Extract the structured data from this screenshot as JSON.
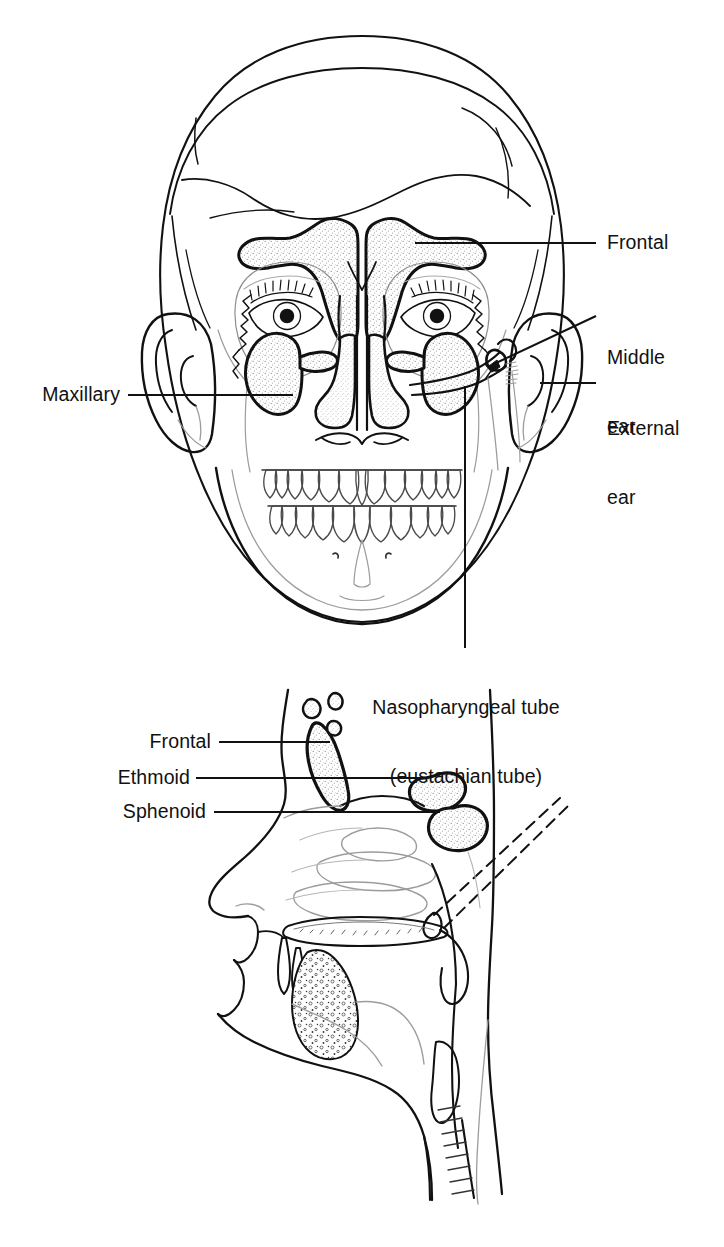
{
  "figure": {
    "kind": "anatomical-line-drawing",
    "panels": [
      {
        "id": "anterior-view",
        "name": "Anterior (frontal) view of skull with sinuses",
        "description": "Front-facing head showing frontal and maxillary sinuses, nasal cavity, orbits, eyes, ears, teeth and mandible"
      },
      {
        "id": "sagittal-view",
        "name": "Midsagittal section of head",
        "description": "Side cut-away showing frontal, ethmoid and sphenoid sinuses, turbinates, hard palate, tongue, epiglottis and pharynx"
      }
    ],
    "ink_color": "#111111",
    "background_color": "#ffffff",
    "stipple_color": "#9a9a9a"
  },
  "labels": {
    "frontal_top": "Frontal",
    "middle_ear_line1": "Middle",
    "middle_ear_line2": "ear",
    "external_ear_line1": "External",
    "external_ear_line2": "ear",
    "maxillary": "Maxillary",
    "nasopharyngeal_line1": "Nasopharyngeal tube",
    "nasopharyngeal_line2": "(eustachian tube)",
    "frontal_lower": "Frontal",
    "ethmoid": "Ethmoid",
    "sphenoid": "Sphenoid"
  },
  "structures": {
    "anterior": [
      "frontal sinus (left)",
      "frontal sinus (right)",
      "maxillary sinus (left)",
      "maxillary sinus (right)",
      "nasal cavity",
      "nasal septum",
      "orbit",
      "eye",
      "external ear",
      "middle ear",
      "eustachian tube",
      "maxillary teeth",
      "mandibular teeth",
      "mandible"
    ],
    "sagittal": [
      "frontal sinus",
      "ethmoid air cells",
      "ethmoid sinus",
      "sphenoid sinus",
      "superior turbinate",
      "middle turbinate",
      "inferior turbinate",
      "hard palate",
      "soft palate",
      "tongue",
      "epiglottis",
      "nasopharynx",
      "oropharynx",
      "trachea",
      "eustachian tube (dashed)"
    ]
  }
}
